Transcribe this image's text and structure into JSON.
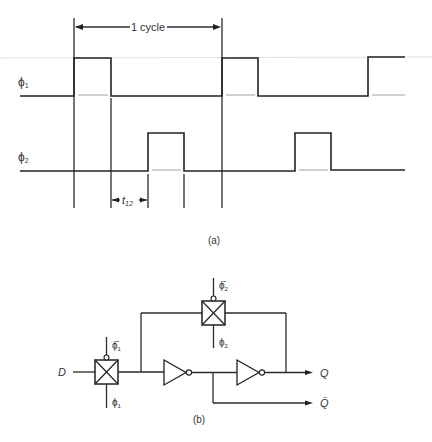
{
  "figure_a": {
    "cycle_label": "1 cycle",
    "phi1_label": "ϕ",
    "phi1_sub": "1",
    "phi2_label": "ϕ",
    "phi2_sub": "2",
    "t12_label": "t",
    "t12_sub": "12",
    "caption": "(a)"
  },
  "figure_b": {
    "input_label": "D",
    "output_q": "Q",
    "output_qbar": "Q̄",
    "tg1_top_label": "ϕ̄",
    "tg1_top_sub": "1",
    "tg1_bottom_label": "ϕ",
    "tg1_bottom_sub": "1",
    "tg2_top_label": "ϕ̄",
    "tg2_top_sub": "2",
    "tg2_bottom_label": "ϕ",
    "tg2_bottom_sub": "2",
    "caption": "(b)"
  }
}
